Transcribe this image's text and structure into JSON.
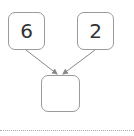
{
  "diagram": {
    "type": "number-bond",
    "parts": [
      {
        "id": "left",
        "value": "6"
      },
      {
        "id": "right",
        "value": "2"
      }
    ],
    "whole": {
      "id": "bottom",
      "value": ""
    },
    "arrows": [
      {
        "from": "left",
        "to": "bottom"
      },
      {
        "from": "right",
        "to": "bottom"
      }
    ],
    "colors": {
      "border": "#9a9a9a",
      "arrow": "#888888",
      "text": "#333333"
    }
  }
}
